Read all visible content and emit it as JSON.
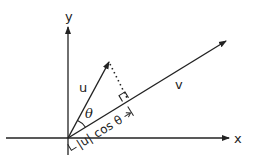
{
  "diagram": {
    "stroke_color": "#222222",
    "axes": {
      "x_label": "x",
      "y_label": "y"
    },
    "vectors": [
      {
        "name": "u",
        "label": "u"
      },
      {
        "name": "v",
        "label": "v"
      }
    ],
    "angle_label": "θ",
    "projection_label": {
      "left_bracket": "⊢",
      "abs_u": "|u|",
      "cos_theta": "cos θ",
      "right_bracket": "→|"
    }
  }
}
